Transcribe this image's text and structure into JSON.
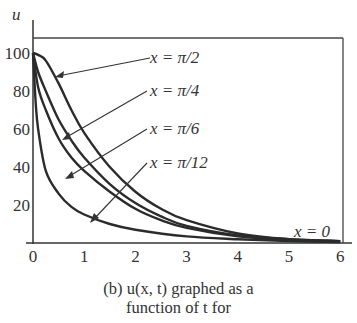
{
  "chart_data": {
    "type": "line",
    "title": "",
    "xlabel": "t",
    "ylabel": "u",
    "xlim": [
      0,
      6
    ],
    "ylim": [
      0,
      110
    ],
    "x_ticks": [
      "0",
      "1",
      "2",
      "3",
      "4",
      "5",
      "6"
    ],
    "y_ticks": [
      "20",
      "40",
      "60",
      "80",
      "100"
    ],
    "grid": false,
    "legend": "annotations with arrows",
    "series": [
      {
        "name": "x = π/2",
        "x": [
          0,
          0.1,
          0.25,
          0.5,
          0.75,
          1,
          1.5,
          2,
          2.5,
          3,
          4,
          5,
          6
        ],
        "values": [
          100,
          99,
          96,
          84,
          70,
          58,
          40,
          27,
          18,
          12,
          5,
          2,
          1
        ]
      },
      {
        "name": "x = π/4",
        "x": [
          0,
          0.1,
          0.25,
          0.5,
          0.75,
          1,
          1.5,
          2,
          2.5,
          3,
          4,
          5,
          6
        ],
        "values": [
          100,
          90,
          80,
          65,
          54,
          45,
          31,
          21,
          14,
          9,
          4,
          2,
          1
        ]
      },
      {
        "name": "x = π/6",
        "x": [
          0,
          0.1,
          0.25,
          0.5,
          0.75,
          1,
          1.5,
          2,
          2.5,
          3,
          4,
          5,
          6
        ],
        "values": [
          100,
          82,
          70,
          55,
          45,
          38,
          27,
          18,
          12,
          8,
          3.5,
          1.5,
          1
        ]
      },
      {
        "name": "x = π/12",
        "x": [
          0,
          0.05,
          0.1,
          0.25,
          0.5,
          0.75,
          1,
          1.5,
          2,
          3,
          4,
          5,
          6
        ],
        "values": [
          100,
          75,
          60,
          38,
          26,
          19,
          15,
          10,
          7,
          3.5,
          2,
          1,
          0.5
        ]
      },
      {
        "name": "x = 0",
        "x": [
          0,
          6
        ],
        "values": [
          0,
          0
        ]
      }
    ],
    "annotations": [
      "x = π/2",
      "x = π/4",
      "x = π/6",
      "x = π/12",
      "x = 0"
    ]
  },
  "labels": {
    "y_axis": "u",
    "ann_pi2": "x = π/2",
    "ann_pi4": "x = π/4",
    "ann_pi6": "x = π/6",
    "ann_pi12": "x = π/12",
    "ann_zero": "x = 0"
  },
  "caption": {
    "line1": "(b) u(x, t) graphed as a",
    "line2": "function of t for"
  }
}
